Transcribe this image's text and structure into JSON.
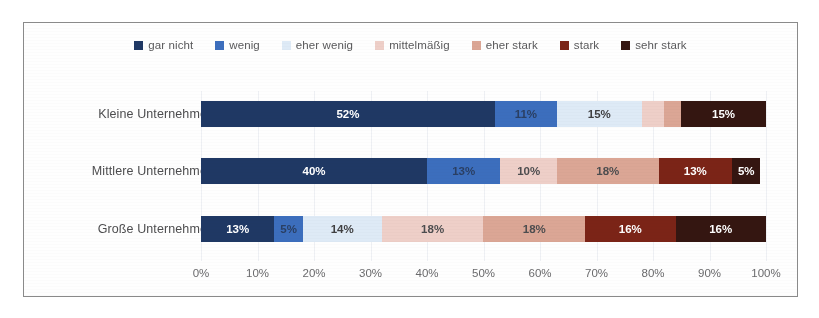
{
  "chart_data": {
    "type": "bar",
    "orientation": "horizontal",
    "stacked": true,
    "stack_mode": "percent",
    "title": "",
    "subtitle": "",
    "xlabel": "",
    "ylabel": "",
    "xlim": [
      0,
      100
    ],
    "grid": true,
    "legend_position": "top",
    "categories": [
      "Kleine Unternehmen",
      "Mittlere Unternehmen",
      "Große Unternehmen"
    ],
    "xticks": [
      "0%",
      "10%",
      "20%",
      "30%",
      "40%",
      "50%",
      "60%",
      "70%",
      "80%",
      "90%",
      "100%"
    ],
    "xtick_values": [
      0,
      10,
      20,
      30,
      40,
      50,
      60,
      70,
      80,
      90,
      100
    ],
    "series": [
      {
        "name": "gar nicht",
        "color": "#1f3864",
        "label_color": "#ffffff",
        "values": [
          52,
          40,
          13
        ],
        "labels": [
          "52%",
          "40%",
          "13%"
        ]
      },
      {
        "name": "wenig",
        "color": "#3c6ebd",
        "label_color": "#2a3f63",
        "values": [
          11,
          13,
          5
        ],
        "labels": [
          "11%",
          "13%",
          "5%"
        ]
      },
      {
        "name": "eher wenig",
        "color": "#deeaf6",
        "label_color": "#3f3f41",
        "values": [
          15,
          0,
          14
        ],
        "labels": [
          "15%",
          "",
          "14%"
        ]
      },
      {
        "name": "mittelmäßig",
        "color": "#eecfc8",
        "label_color": "#4d4d4f",
        "values": [
          4,
          10,
          18
        ],
        "labels": [
          "",
          "10%",
          "18%"
        ]
      },
      {
        "name": "eher stark",
        "color": "#dba695",
        "label_color": "#4d4d4f",
        "values": [
          3,
          18,
          18
        ],
        "labels": [
          "",
          "18%",
          "18%"
        ]
      },
      {
        "name": "stark",
        "color": "#7b2417",
        "label_color": "#ffffff",
        "values": [
          0,
          13,
          16
        ],
        "labels": [
          "",
          "13%",
          "16%"
        ]
      },
      {
        "name": "sehr stark",
        "color": "#341611",
        "label_color": "#ffffff",
        "values": [
          15,
          5,
          16
        ],
        "labels": [
          "15%",
          "5%",
          "16%"
        ]
      }
    ]
  },
  "frame": {
    "border_color": "#8a8a8a"
  }
}
